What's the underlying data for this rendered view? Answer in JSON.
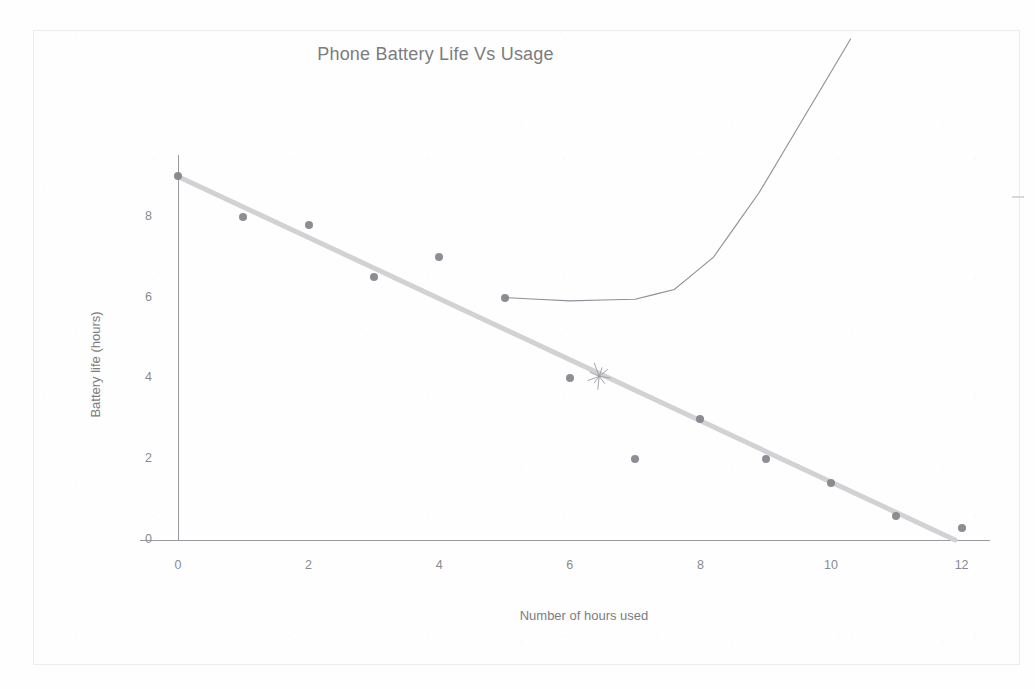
{
  "chart_data": {
    "type": "scatter",
    "title": "Phone Battery Life Vs Usage",
    "xlabel": "Number of hours used",
    "ylabel": "Battery life (hours)",
    "xlim": [
      0,
      12.5
    ],
    "ylim": [
      0,
      9.5
    ],
    "xticks": [
      "0",
      "2",
      "4",
      "6",
      "8",
      "10",
      "12"
    ],
    "yticks": [
      "0",
      "2",
      "4",
      "6",
      "8"
    ],
    "xtick_values": [
      0,
      2,
      4,
      6,
      8,
      10,
      12
    ],
    "ytick_values": [
      0,
      2,
      4,
      6,
      8
    ],
    "grid": false,
    "legend": false,
    "series": [
      {
        "name": "Battery life",
        "marker": "circle",
        "color": "#83838a",
        "x": [
          0,
          1,
          2,
          3,
          4,
          5,
          6,
          7,
          8,
          9,
          10,
          11,
          12
        ],
        "y": [
          9,
          8,
          7.8,
          6.5,
          7,
          6,
          4,
          2,
          3,
          2,
          1.4,
          0.6,
          0.3
        ]
      }
    ],
    "trendline": {
      "name": "Linear trendline",
      "color": "#d2d2d4",
      "x_start": 0,
      "y_start": 9,
      "x_end": 11.9,
      "y_end": 0
    },
    "annotations": [
      {
        "name": "asterisk-mark",
        "kind": "hand-drawn-asterisk",
        "x": 6.45,
        "y": 4.05,
        "color": "#9b9ba2"
      },
      {
        "name": "exponential-sketch-curve",
        "kind": "hand-drawn-curve",
        "color": "#8e8e96",
        "description": "thin curve from the (5, 6) point sweeping right then rising steeply off the top of the page",
        "points": [
          [
            5,
            6
          ],
          [
            6,
            5.92
          ],
          [
            7,
            5.96
          ],
          [
            7.6,
            6.2
          ],
          [
            8.2,
            7.0
          ],
          [
            8.9,
            8.6
          ],
          [
            9.6,
            10.5
          ],
          [
            10.3,
            12.4
          ]
        ]
      },
      {
        "name": "right-margin-dash",
        "kind": "stray-pencil-dash",
        "color": "#d8d8dc"
      }
    ]
  },
  "page": {
    "frame_label": "chart-border"
  }
}
